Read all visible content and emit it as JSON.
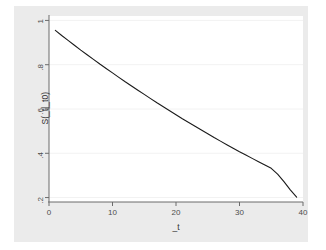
{
  "chart_data": {
    "type": "line",
    "title": "",
    "subtitle": "",
    "xlabel": "_t",
    "ylabel": "S(_t|_t0)",
    "xlim": [
      0,
      40
    ],
    "ylim": [
      0.18,
      1.02
    ],
    "xticks": [
      0,
      10,
      20,
      30,
      40
    ],
    "xtick_labels": [
      "0",
      "10",
      "20",
      "30",
      "40"
    ],
    "yticks": [
      0.2,
      0.4,
      0.6,
      0.8,
      1
    ],
    "ytick_labels": [
      ".2",
      ".4",
      ".6",
      ".8",
      "1"
    ],
    "grid": "horizontal",
    "legend": "none",
    "annotations": [],
    "series": [
      {
        "name": "S(_t|_t0)",
        "color": "#1a1a1a",
        "x": [
          1,
          2,
          3,
          4,
          5,
          6,
          7,
          8,
          9,
          10,
          11,
          12,
          13,
          14,
          15,
          16,
          17,
          18,
          19,
          20,
          21,
          22,
          23,
          24,
          25,
          26,
          27,
          28,
          29,
          30,
          31,
          32,
          33,
          34,
          35,
          36,
          37,
          38,
          39
        ],
        "y": [
          0.955,
          0.932,
          0.91,
          0.888,
          0.866,
          0.845,
          0.824,
          0.803,
          0.783,
          0.763,
          0.743,
          0.723,
          0.704,
          0.685,
          0.666,
          0.647,
          0.628,
          0.61,
          0.592,
          0.574,
          0.556,
          0.539,
          0.522,
          0.505,
          0.488,
          0.471,
          0.455,
          0.439,
          0.423,
          0.407,
          0.392,
          0.377,
          0.362,
          0.347,
          0.332,
          0.306,
          0.272,
          0.235,
          0.202
        ]
      }
    ]
  },
  "figure": {
    "background_color": "#ffffff",
    "canvas_color": "#ebebeb",
    "plot_color": "#ffffff",
    "gridline_color": "#f2f2f2",
    "axis_color": "#6b6b6b",
    "line_color": "#1a1a1a"
  }
}
